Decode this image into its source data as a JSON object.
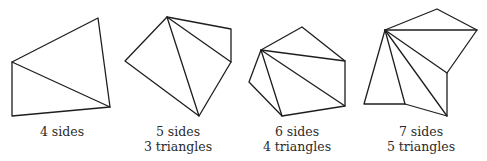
{
  "figures": [
    {
      "id": "quadrilateral",
      "sides_label": "4 sides",
      "triangles_label": "",
      "vertices": [
        [
          12,
          62
        ],
        [
          98,
          18
        ],
        [
          110,
          107
        ],
        [
          12,
          116
        ]
      ],
      "diagonals": [
        [
          [
            12,
            62
          ],
          [
            110,
            107
          ]
        ]
      ],
      "caption_center_x": 62
    },
    {
      "id": "pentagon",
      "sides_label": "5 sides",
      "triangles_label": "3 triangles",
      "vertices": [
        [
          167,
          17
        ],
        [
          231,
          29
        ],
        [
          231,
          62
        ],
        [
          199,
          116
        ],
        [
          125,
          61
        ]
      ],
      "diagonals": [
        [
          [
            167,
            17
          ],
          [
            231,
            62
          ]
        ],
        [
          [
            167,
            17
          ],
          [
            199,
            116
          ]
        ]
      ],
      "caption_center_x": 178
    },
    {
      "id": "hexagon",
      "sides_label": "6 sides",
      "triangles_label": "4 triangles",
      "vertices": [
        [
          261,
          50
        ],
        [
          302,
          27
        ],
        [
          345,
          61
        ],
        [
          345,
          106
        ],
        [
          282,
          116
        ],
        [
          249,
          82
        ]
      ],
      "diagonals": [
        [
          [
            261,
            50
          ],
          [
            345,
            61
          ]
        ],
        [
          [
            261,
            50
          ],
          [
            345,
            106
          ]
        ],
        [
          [
            261,
            50
          ],
          [
            282,
            116
          ]
        ]
      ],
      "caption_center_x": 297
    },
    {
      "id": "heptagon",
      "sides_label": "7 sides",
      "triangles_label": "5 triangles",
      "vertices": [
        [
          385,
          30
        ],
        [
          437,
          9
        ],
        [
          477,
          30
        ],
        [
          447,
          73
        ],
        [
          447,
          116
        ],
        [
          405,
          104
        ],
        [
          364,
          104
        ]
      ],
      "diagonals": [
        [
          [
            385,
            30
          ],
          [
            477,
            30
          ]
        ],
        [
          [
            385,
            30
          ],
          [
            447,
            73
          ]
        ],
        [
          [
            385,
            30
          ],
          [
            447,
            116
          ]
        ],
        [
          [
            385,
            30
          ],
          [
            405,
            104
          ]
        ]
      ],
      "caption_center_x": 421
    }
  ],
  "style": {
    "stroke_color": "#1e1e1e",
    "text_color": "#2a2a2a",
    "background": "#ffffff"
  }
}
